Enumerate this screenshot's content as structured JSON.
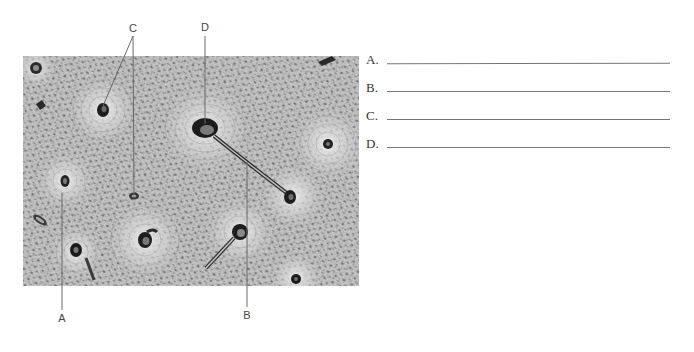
{
  "figure": {
    "type": "micrograph-labeling-exercise",
    "callouts": [
      {
        "id": "A",
        "letter": "A",
        "x": 62,
        "y": 318
      },
      {
        "id": "B",
        "letter": "B",
        "x": 247,
        "y": 315
      },
      {
        "id": "C",
        "letter": "C",
        "x": 133,
        "y": 28
      },
      {
        "id": "D",
        "letter": "D",
        "x": 205,
        "y": 27
      }
    ]
  },
  "answers": [
    {
      "key": "A.",
      "value": ""
    },
    {
      "key": "B.",
      "value": ""
    },
    {
      "key": "C.",
      "value": ""
    },
    {
      "key": "D.",
      "value": ""
    }
  ]
}
